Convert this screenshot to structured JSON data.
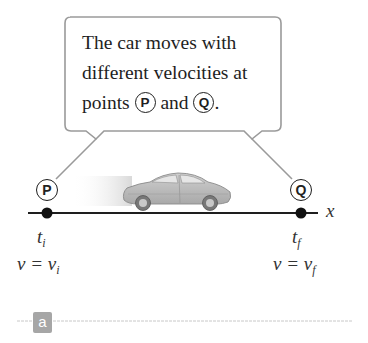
{
  "callout": {
    "line1": "The car moves with",
    "line2": "different velocities at",
    "line3_prefix": "points ",
    "point_p": "P",
    "line3_mid": " and ",
    "point_q": "Q",
    "line3_suffix": "."
  },
  "axis": {
    "label": "x"
  },
  "points": {
    "p": {
      "label": "P",
      "time_var": "t",
      "time_sub": "i",
      "velocity_lhs": "v = v",
      "velocity_sub": "i"
    },
    "q": {
      "label": "Q",
      "time_var": "t",
      "time_sub": "f",
      "velocity_lhs": "v = v",
      "velocity_sub": "f"
    }
  },
  "panel": {
    "label": "a"
  },
  "colors": {
    "callout_border": "#9a9a9a",
    "axis": "#1e1e1e",
    "dot": "#111111",
    "car_body": "#b5b5b5",
    "badge_bg": "#a6a6a6",
    "divider": "#c8c8c8"
  }
}
